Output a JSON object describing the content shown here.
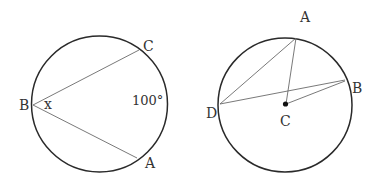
{
  "left_figure": {
    "labels": {
      "B": "B",
      "C": "C",
      "A": "A",
      "angle": "x",
      "arc": "100°"
    },
    "circle": {
      "cx": 99.5,
      "cy": 104,
      "r": 68
    },
    "points": {
      "B": [
        33,
        105
      ],
      "C": [
        139,
        50
      ],
      "A": [
        137,
        158
      ]
    }
  },
  "right_figure": {
    "labels": {
      "A": "A",
      "B": "B",
      "C": "C",
      "D": "D"
    },
    "circle": {
      "cx": 285,
      "cy": 105,
      "r": 67
    },
    "points": {
      "A": [
        296,
        38
      ],
      "B": [
        345,
        80
      ],
      "D": [
        220,
        104
      ],
      "C": [
        285,
        104
      ]
    }
  },
  "colors": {
    "circle": "#2a2a2a",
    "chord": "#6a6a6a",
    "text": "#333333"
  }
}
